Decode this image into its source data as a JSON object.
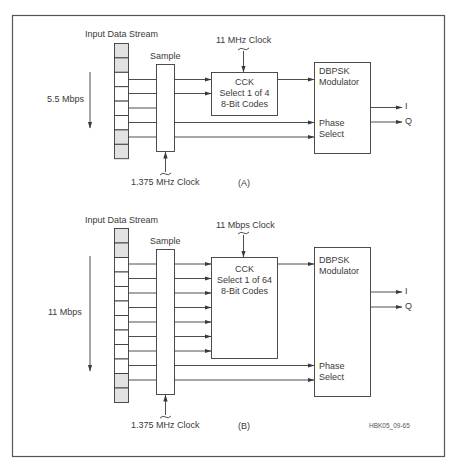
{
  "figure_id": "HBK05_09-65",
  "panels": [
    {
      "id": "A",
      "caption": "(A)",
      "input_label": "Input Data Stream",
      "rate_label": "5.5 Mbps",
      "sample_label": "Sample",
      "sample_clock": "1.375 MHz Clock",
      "cck_clock": "11 MHz Clock",
      "cck": {
        "line1": "CCK",
        "line2": "Select 1 of 4",
        "line3": "8-Bit Codes"
      },
      "modulator": {
        "line1": "DBPSK",
        "line2": "Modulator"
      },
      "phase": {
        "line1": "Phase",
        "line2": "Select"
      },
      "out_i": "I",
      "out_q": "Q",
      "stream_cells": 8,
      "shaded_cells": [
        1,
        2,
        7,
        8
      ],
      "bits_to_cck": 2,
      "bits_to_phase": 2
    },
    {
      "id": "B",
      "caption": "(B)",
      "input_label": "Input Data Stream",
      "rate_label": "11 Mbps",
      "sample_label": "Sample",
      "sample_clock": "1.375 MHz Clock",
      "cck_clock": "11 Mbps Clock",
      "cck": {
        "line1": "CCK",
        "line2": "Select 1 of 64",
        "line3": "8-Bit Codes"
      },
      "modulator": {
        "line1": "DBPSK",
        "line2": "Modulator"
      },
      "phase": {
        "line1": "Phase",
        "line2": "Select"
      },
      "out_i": "I",
      "out_q": "Q",
      "stream_cells": 12,
      "shaded_cells": [
        1,
        2,
        11,
        12
      ],
      "bits_to_cck": 7,
      "bits_to_phase": 2
    }
  ],
  "colors": {
    "line": "#3a3a3a",
    "shade": "#e2e2e2",
    "border": "#555555"
  }
}
